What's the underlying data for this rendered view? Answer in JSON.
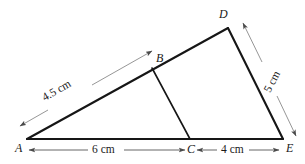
{
  "figure": {
    "canvas": {
      "width": 305,
      "height": 164
    },
    "background_color": "#ffffff",
    "shape_stroke_color": "#161616",
    "dimension_stroke_color": "#8a8a8a",
    "label_color": "#1a1a1a"
  },
  "vertices": [
    {
      "name": "A",
      "label": "A",
      "x": 27,
      "y": 139,
      "label_x": 15,
      "label_y": 142
    },
    {
      "name": "B",
      "label": "B",
      "x": 152,
      "y": 68,
      "label_x": 156,
      "label_y": 52
    },
    {
      "name": "C",
      "label": "C",
      "x": 190,
      "y": 139,
      "label_x": 187,
      "label_y": 143
    },
    {
      "name": "D",
      "label": "D",
      "x": 228,
      "y": 28,
      "label_x": 219,
      "label_y": 8
    },
    {
      "name": "E",
      "label": "E",
      "x": 283,
      "y": 139,
      "label_x": 286,
      "label_y": 142
    }
  ],
  "segments": [
    {
      "name": "side-ad",
      "from": "A",
      "to": "D",
      "x1": 27,
      "y1": 139,
      "x2": 228,
      "y2": 28
    },
    {
      "name": "side-de",
      "from": "D",
      "to": "E",
      "x1": 228,
      "y1": 28,
      "x2": 283,
      "y2": 139
    },
    {
      "name": "side-ae",
      "from": "A",
      "to": "E",
      "x1": 27,
      "y1": 139,
      "x2": 283,
      "y2": 139
    },
    {
      "name": "cevian-bc",
      "from": "B",
      "to": "C",
      "x1": 152,
      "y1": 68,
      "x2": 190,
      "y2": 139
    }
  ],
  "measurements": [
    {
      "name": "ab-length",
      "text": "4.5 cm",
      "value": 4.5,
      "unit": "cm",
      "of_segment": "AB",
      "label_x": 62,
      "label_y": 92,
      "line_1": {
        "x1": 20,
        "y1": 126,
        "x2": 48,
        "y2": 110
      },
      "line_2": {
        "x1": 92,
        "y1": 85,
        "x2": 152,
        "y2": 51
      },
      "arrow_start": {
        "x": 20,
        "y": 126
      },
      "arrow_end": {
        "x": 152,
        "y": 51
      }
    },
    {
      "name": "de-length",
      "text": "5 cm",
      "value": 5,
      "unit": "cm",
      "of_segment": "DE",
      "label_x": 273,
      "label_y": 82,
      "line_1": {
        "x1": 243,
        "y1": 23,
        "x2": 262,
        "y2": 62
      },
      "line_2": {
        "x1": 277,
        "y1": 96,
        "x2": 296,
        "y2": 136
      },
      "arrow_start": {
        "x": 243,
        "y": 23
      },
      "arrow_end": {
        "x": 296,
        "y": 136
      }
    },
    {
      "name": "ac-length",
      "text": "6 cm",
      "value": 6,
      "unit": "cm",
      "of_segment": "AC",
      "label_x": 105,
      "label_y": 150,
      "line_1": {
        "x1": 29,
        "y1": 150,
        "x2": 88,
        "y2": 150
      },
      "line_2": {
        "x1": 124,
        "y1": 150,
        "x2": 185,
        "y2": 150
      },
      "arrow_start": {
        "x": 29,
        "y": 150
      },
      "arrow_end": {
        "x": 185,
        "y": 150
      }
    },
    {
      "name": "ce-length",
      "text": "4 cm",
      "value": 4,
      "unit": "cm",
      "of_segment": "CE",
      "label_x": 232,
      "label_y": 150,
      "line_1": {
        "x1": 197,
        "y1": 150,
        "x2": 217,
        "y2": 150
      },
      "line_2": {
        "x1": 249,
        "y1": 150,
        "x2": 279,
        "y2": 150
      },
      "arrow_start": {
        "x": 197,
        "y": 150
      },
      "arrow_end": {
        "x": 279,
        "y": 150
      }
    }
  ]
}
